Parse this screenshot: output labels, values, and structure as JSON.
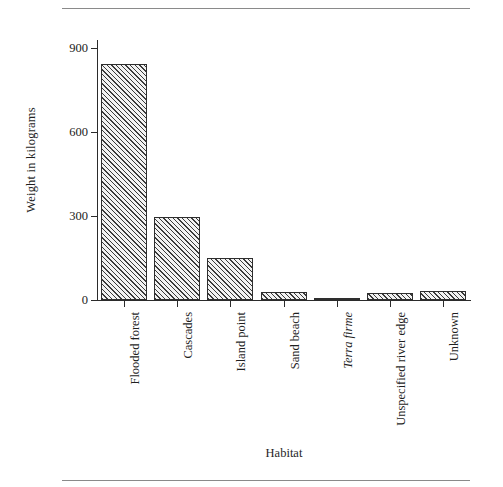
{
  "figure": {
    "has_top_rule": true,
    "has_bottom_rule": true,
    "background_color": "#ffffff",
    "bar_edge_color": "#2e2e2e",
    "bar_hatch": "diagonal-45",
    "axis_color": "#2b2b2b"
  },
  "chart_data": {
    "type": "bar",
    "title": "",
    "xlabel": "Habitat",
    "ylabel": "Weight in kilograms",
    "categories": [
      "Flooded forest",
      "Cascades",
      "Island point",
      "Sand beach",
      "Terra firme",
      "Unspecified river edge",
      "Unknown"
    ],
    "category_styles": [
      "normal",
      "normal",
      "normal",
      "normal",
      "italic",
      "normal",
      "normal"
    ],
    "values": [
      845,
      298,
      151,
      30,
      6,
      25,
      31
    ],
    "ylim": [
      0,
      930
    ],
    "yticks": [
      0,
      300,
      600,
      900
    ],
    "ytick_labels": [
      "0",
      "300",
      "600",
      "900"
    ],
    "grid": false,
    "legend": false
  }
}
